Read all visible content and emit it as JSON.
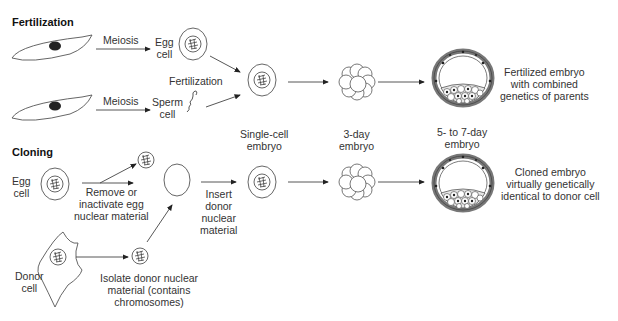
{
  "sections": {
    "fertilization": "Fertilization",
    "cloning": "Cloning"
  },
  "fertilization": {
    "meiosis_top": "Meiosis",
    "meiosis_bottom": "Meiosis",
    "egg_cell": [
      "Egg",
      "cell"
    ],
    "sperm_cell": [
      "Sperm",
      "cell"
    ],
    "fertilization_label": "Fertilization",
    "result": [
      "Fertilized embryo",
      "with combined",
      "genetics of parents"
    ]
  },
  "stages": {
    "single_cell": [
      "Single-cell",
      "embryo"
    ],
    "three_day": [
      "3-day",
      "embryo"
    ],
    "five_seven_day": [
      "5- to 7-day",
      "embryo"
    ]
  },
  "cloning": {
    "egg_cell": [
      "Egg",
      "cell"
    ],
    "remove_step": [
      "Remove or",
      "inactivate egg",
      "nuclear material"
    ],
    "insert_step": [
      "Insert",
      "donor",
      "nuclear",
      "material"
    ],
    "donor_cell": [
      "Donor",
      "cell"
    ],
    "isolate_step": [
      "Isolate donor nuclear",
      "material (contains",
      "chromosomes)"
    ],
    "result": [
      "Cloned embryo",
      "virtually genetically",
      "identical to donor cell"
    ]
  },
  "colors": {
    "line": "#555555",
    "nucleus_dark": "#222222",
    "cell_fill": "#9a9a9a"
  }
}
